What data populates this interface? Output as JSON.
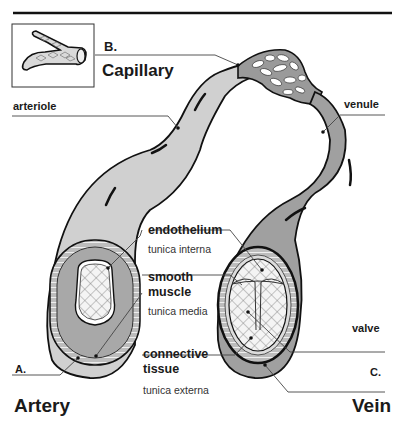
{
  "diagram": {
    "topic": "Blood vessel types: artery, capillary, vein",
    "inset": {
      "icon": "capillary-branch-icon"
    },
    "labels": {
      "b_letter": "B.",
      "capillary": "Capillary",
      "arteriole": "arteriole",
      "venule": "venule",
      "endothelium": "endothelium",
      "tunica_interna": "tunica interna",
      "smooth": "smooth",
      "muscle": "muscle",
      "tunica_media": "tunica media",
      "connective": "connective",
      "tissue": "tissue",
      "tunica_externa": "tunica externa",
      "valve": "valve",
      "a_letter": "A.",
      "artery": "Artery",
      "c_letter": "C.",
      "vein": "Vein"
    },
    "colors": {
      "artery_fill": "#cfcfcf",
      "vein_fill": "#9e9e9e",
      "outline": "#111111",
      "media_ring": "#a8a8a8",
      "lumen": "#f2f2f2",
      "leader_line": "#444444"
    }
  }
}
